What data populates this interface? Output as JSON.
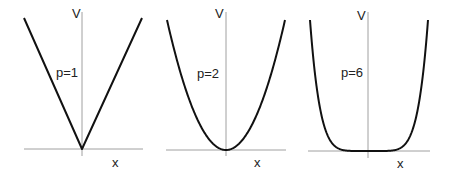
{
  "chart_data": [
    {
      "type": "line",
      "title": "",
      "annotation": "p=1",
      "xlabel": "x",
      "ylabel": "V",
      "function": "V = |x|^1",
      "x": [
        -1,
        -0.5,
        0,
        0.5,
        1
      ],
      "values": [
        1,
        0.5,
        0,
        0.5,
        1
      ],
      "grid": false
    },
    {
      "type": "line",
      "title": "",
      "annotation": "p=2",
      "xlabel": "x",
      "ylabel": "V",
      "function": "V = |x|^2",
      "x": [
        -1,
        -0.5,
        0,
        0.5,
        1
      ],
      "values": [
        1,
        0.25,
        0,
        0.25,
        1
      ],
      "grid": false
    },
    {
      "type": "line",
      "title": "",
      "annotation": "p=6",
      "xlabel": "x",
      "ylabel": "V",
      "function": "V = |x|^6",
      "x": [
        -1,
        -0.5,
        0,
        0.5,
        1
      ],
      "values": [
        1,
        0.015625,
        0,
        0.015625,
        1
      ],
      "grid": false
    }
  ],
  "panels": [
    {
      "ylabel": "V",
      "xlabel": "x",
      "annotation": "p=1"
    },
    {
      "ylabel": "V",
      "xlabel": "x",
      "annotation": "p=2"
    },
    {
      "ylabel": "V",
      "xlabel": "x",
      "annotation": "p=6"
    }
  ]
}
